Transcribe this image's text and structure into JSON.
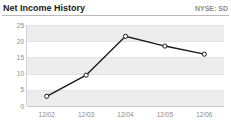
{
  "header": {
    "title": "Net Income History",
    "ticker": "NYSE: SD"
  },
  "chart_data": {
    "type": "line",
    "title": "Net Income History",
    "xlabel": "",
    "ylabel": "",
    "categories": [
      "12/02",
      "12/03",
      "12/04",
      "12/05",
      "12/06"
    ],
    "values": [
      3,
      9.5,
      21.5,
      18.5,
      16
    ],
    "series": [
      {
        "name": "Net Income",
        "values": [
          3,
          9.5,
          21.5,
          18.5,
          16
        ]
      }
    ],
    "yticks": [
      25,
      20,
      15,
      10,
      5,
      0
    ],
    "ylim": [
      0,
      25
    ],
    "grid": true,
    "legend": "none",
    "line_color": "#1a1a1a",
    "marker": "open-circle",
    "marker_fill": "#ffffff",
    "band_color": "#ececec",
    "axis_text_color": "#8a8a8a"
  }
}
